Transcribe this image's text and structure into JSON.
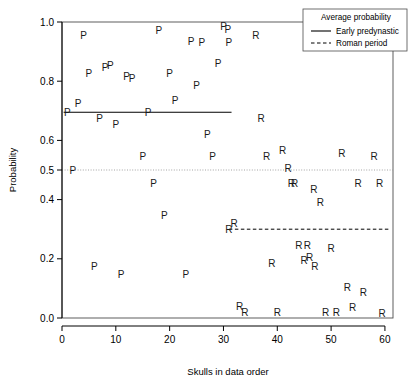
{
  "chart_data": {
    "type": "scatter",
    "title": "",
    "xlabel": "Skulls in data order",
    "ylabel": "Probability",
    "xlim": [
      0,
      61.5
    ],
    "ylim": [
      0.0,
      1.0
    ],
    "xticks": [
      0,
      10,
      20,
      30,
      40,
      50,
      60
    ],
    "xticklabels": [
      "0",
      "10",
      "20",
      "30",
      "40",
      "50",
      "60"
    ],
    "yticks": [
      0.0,
      0.2,
      0.4,
      0.5,
      0.6,
      0.8,
      1.0
    ],
    "yticklabels": [
      "0.0",
      "0.2",
      "0.4",
      "0.5",
      "0.6",
      "0.8",
      "1.0"
    ],
    "grid": false,
    "point_marker": "text-letter",
    "series": [
      {
        "name": "Early predynastic",
        "marker_letter": "P",
        "points": [
          {
            "x": 1,
            "y": 0.695
          },
          {
            "x": 2,
            "y": 0.5
          },
          {
            "x": 3,
            "y": 0.725
          },
          {
            "x": 4,
            "y": 0.955
          },
          {
            "x": 5,
            "y": 0.825
          },
          {
            "x": 6,
            "y": 0.175
          },
          {
            "x": 7,
            "y": 0.675
          },
          {
            "x": 8,
            "y": 0.845
          },
          {
            "x": 9,
            "y": 0.855
          },
          {
            "x": 10,
            "y": 0.655
          },
          {
            "x": 11,
            "y": 0.148
          },
          {
            "x": 12,
            "y": 0.815
          },
          {
            "x": 13,
            "y": 0.81
          },
          {
            "x": 15,
            "y": 0.545
          },
          {
            "x": 16,
            "y": 0.695
          },
          {
            "x": 17,
            "y": 0.455
          },
          {
            "x": 18,
            "y": 0.97
          },
          {
            "x": 19,
            "y": 0.345
          },
          {
            "x": 20,
            "y": 0.825
          },
          {
            "x": 21,
            "y": 0.735
          },
          {
            "x": 23,
            "y": 0.148
          },
          {
            "x": 24,
            "y": 0.935
          },
          {
            "x": 25,
            "y": 0.785
          },
          {
            "x": 26,
            "y": 0.93
          },
          {
            "x": 27,
            "y": 0.62
          },
          {
            "x": 28,
            "y": 0.545
          },
          {
            "x": 29,
            "y": 0.86
          },
          {
            "x": 30,
            "y": 0.985
          },
          {
            "x": 30.8,
            "y": 0.975
          },
          {
            "x": 31,
            "y": 0.93
          }
        ]
      },
      {
        "name": "Roman period",
        "marker_letter": "R",
        "points": [
          {
            "x": 31,
            "y": 0.3
          },
          {
            "x": 32,
            "y": 0.32
          },
          {
            "x": 33,
            "y": 0.04
          },
          {
            "x": 34,
            "y": 0.02
          },
          {
            "x": 36,
            "y": 0.955
          },
          {
            "x": 37,
            "y": 0.675
          },
          {
            "x": 38,
            "y": 0.545
          },
          {
            "x": 39,
            "y": 0.185
          },
          {
            "x": 40,
            "y": 0.02
          },
          {
            "x": 41,
            "y": 0.565
          },
          {
            "x": 42,
            "y": 0.505
          },
          {
            "x": 42.6,
            "y": 0.455
          },
          {
            "x": 43.2,
            "y": 0.455
          },
          {
            "x": 44,
            "y": 0.245
          },
          {
            "x": 45,
            "y": 0.195
          },
          {
            "x": 45.6,
            "y": 0.245
          },
          {
            "x": 46,
            "y": 0.205
          },
          {
            "x": 46.8,
            "y": 0.435
          },
          {
            "x": 47,
            "y": 0.175
          },
          {
            "x": 48,
            "y": 0.39
          },
          {
            "x": 49,
            "y": 0.02
          },
          {
            "x": 50,
            "y": 0.235
          },
          {
            "x": 51,
            "y": 0.02
          },
          {
            "x": 52,
            "y": 0.555
          },
          {
            "x": 53,
            "y": 0.105
          },
          {
            "x": 54,
            "y": 0.035
          },
          {
            "x": 55,
            "y": 0.455
          },
          {
            "x": 56,
            "y": 0.085
          },
          {
            "x": 58,
            "y": 0.545
          },
          {
            "x": 59,
            "y": 0.455
          },
          {
            "x": 59.5,
            "y": 0.015
          }
        ]
      }
    ],
    "reference_lines": [
      {
        "name": "Early predynastic average",
        "style": "solid",
        "y": 0.695,
        "x_start": 0.3,
        "x_end": 31.5
      },
      {
        "name": "Roman period average",
        "style": "dashed",
        "y": 0.3,
        "x_start": 31.0,
        "x_end": 60.8
      },
      {
        "name": "half probability",
        "style": "dotted",
        "y": 0.5,
        "x_start": 0.0,
        "x_end": 61.5
      }
    ]
  },
  "legend": {
    "title": "Average probability",
    "entries": [
      {
        "label": "Early predynastic",
        "style": "solid"
      },
      {
        "label": "Roman period",
        "style": "dashed"
      }
    ]
  }
}
